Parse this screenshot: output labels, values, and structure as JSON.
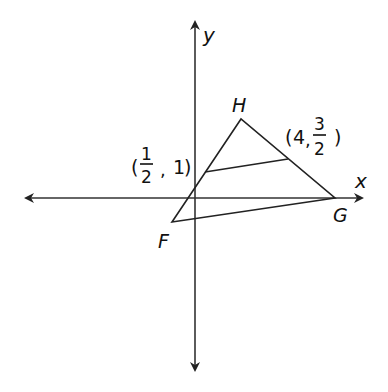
{
  "diagram": {
    "type": "coordinate-geometry",
    "axes": {
      "x_label": "x",
      "y_label": "y"
    },
    "vertices": [
      {
        "name": "H",
        "label": "H"
      },
      {
        "name": "G",
        "label": "G"
      },
      {
        "name": "F",
        "label": "F"
      }
    ],
    "midsegment_endpoints": [
      {
        "open": "(",
        "num": "1",
        "den": "2",
        "sep": ",",
        "y": "1",
        "close": ")"
      },
      {
        "open": "(",
        "x": "4",
        "sep": ",",
        "num": "3",
        "den": "2",
        "close": ")"
      }
    ],
    "colors": {
      "line": "#222222",
      "axis": "#333333",
      "background": "#ffffff"
    }
  }
}
